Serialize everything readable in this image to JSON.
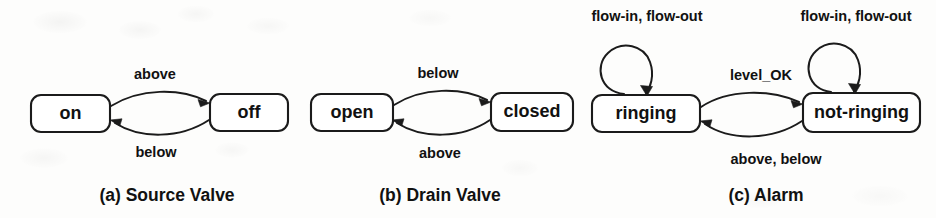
{
  "figure": {
    "background_color": "#fdfdfc",
    "ink_color": "#1b1b1b"
  },
  "panels": [
    {
      "id": "source-valve",
      "caption": "(a) Source Valve",
      "states": [
        {
          "id": "on",
          "label": "on"
        },
        {
          "id": "off",
          "label": "off"
        }
      ],
      "transitions": [
        {
          "from": "on",
          "to": "off",
          "label": "above",
          "position": "top"
        },
        {
          "from": "off",
          "to": "on",
          "label": "below",
          "position": "bottom"
        }
      ]
    },
    {
      "id": "drain-valve",
      "caption": "(b) Drain Valve",
      "states": [
        {
          "id": "open",
          "label": "open"
        },
        {
          "id": "closed",
          "label": "closed"
        }
      ],
      "transitions": [
        {
          "from": "open",
          "to": "closed",
          "label": "below",
          "position": "top"
        },
        {
          "from": "closed",
          "to": "open",
          "label": "above",
          "position": "bottom"
        }
      ]
    },
    {
      "id": "alarm",
      "caption": "(c) Alarm",
      "states": [
        {
          "id": "ringing",
          "label": "ringing"
        },
        {
          "id": "not-ringing",
          "label": "not-ringing"
        }
      ],
      "transitions": [
        {
          "from": "ringing",
          "to": "ringing",
          "label": "flow-in, flow-out",
          "position": "self-loop-left"
        },
        {
          "from": "not-ringing",
          "to": "not-ringing",
          "label": "flow-in, flow-out",
          "position": "self-loop-right"
        },
        {
          "from": "ringing",
          "to": "not-ringing",
          "label": "level_OK",
          "position": "top"
        },
        {
          "from": "not-ringing",
          "to": "ringing",
          "label": "above, below",
          "position": "bottom"
        }
      ]
    }
  ]
}
